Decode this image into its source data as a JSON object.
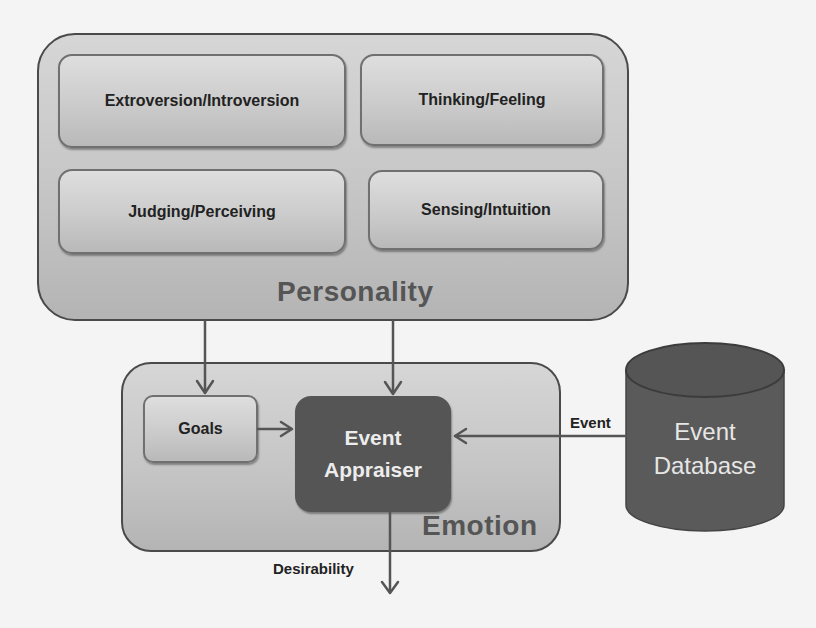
{
  "diagram": {
    "personality": {
      "label": "Personality",
      "traits": [
        {
          "label": "Extroversion/Introversion"
        },
        {
          "label": "Thinking/Feeling"
        },
        {
          "label": "Judging/Perceiving"
        },
        {
          "label": "Sensing/Intuition"
        }
      ]
    },
    "emotion": {
      "label": "Emotion",
      "goals": {
        "label": "Goals"
      },
      "appraiser": {
        "line1": "Event",
        "line2": "Appraiser"
      }
    },
    "database": {
      "line1": "Event",
      "line2": "Database"
    },
    "edges": {
      "event_label": "Event",
      "desirability_label": "Desirability"
    },
    "colors": {
      "box_fill": "#c8c8c8",
      "appraiser_fill": "#555555",
      "database_fill": "#5a5a5a",
      "arrow": "#555555"
    }
  }
}
